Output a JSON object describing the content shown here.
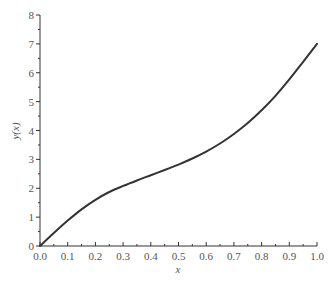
{
  "chart_data": {
    "type": "line",
    "title": "",
    "xlabel": "x",
    "ylabel": "y(x)",
    "xlim": [
      0.0,
      1.0
    ],
    "ylim": [
      0,
      8
    ],
    "grid": false,
    "legend": null,
    "x_ticks": [
      "0.0",
      "0.1",
      "0.2",
      "0.3",
      "0.4",
      "0.5",
      "0.6",
      "0.7",
      "0.8",
      "0.9",
      "1.0"
    ],
    "y_ticks": [
      "0",
      "1",
      "2",
      "3",
      "4",
      "5",
      "6",
      "7",
      "8"
    ],
    "series": [
      {
        "name": "y(x)",
        "color": "#333333",
        "x": [
          0.0,
          0.05,
          0.1,
          0.15,
          0.2,
          0.25,
          0.3,
          0.35,
          0.4,
          0.45,
          0.5,
          0.55,
          0.6,
          0.65,
          0.7,
          0.75,
          0.8,
          0.85,
          0.9,
          0.95,
          1.0
        ],
        "values": [
          0.0,
          0.45,
          0.88,
          1.27,
          1.6,
          1.87,
          2.08,
          2.27,
          2.45,
          2.63,
          2.82,
          3.03,
          3.27,
          3.55,
          3.88,
          4.26,
          4.7,
          5.2,
          5.77,
          6.38,
          7.0
        ]
      }
    ]
  }
}
